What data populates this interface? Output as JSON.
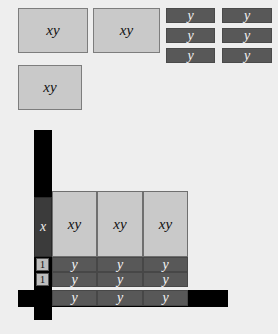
{
  "canvas": {
    "width": 278,
    "height": 334,
    "background": "#eeeeee"
  },
  "colors": {
    "xy_tile_fill": "#c9c9c9",
    "xy_tile_border": "#7d7d7d",
    "y_tile_fill": "#585858",
    "y_tile_text": "#f2f2f2",
    "x_header_fill": "#3b3b3b",
    "one_header_fill": "#bdbdbd",
    "frame_bar": "#000000"
  },
  "tray": {
    "label_xy": "xy",
    "label_y": "y",
    "xy_tiles": [
      {
        "name": "tray-xy-tile-1",
        "x": 18,
        "y": 8,
        "w": 70,
        "h": 45
      },
      {
        "name": "tray-xy-tile-2",
        "x": 93,
        "y": 8,
        "w": 67,
        "h": 45
      },
      {
        "name": "tray-xy-tile-3",
        "x": 18,
        "y": 65,
        "w": 64,
        "h": 45
      }
    ],
    "y_tiles": [
      {
        "name": "tray-y-strip-1",
        "x": 166,
        "y": 8,
        "w": 49,
        "h": 15
      },
      {
        "name": "tray-y-strip-2",
        "x": 222,
        "y": 8,
        "w": 50,
        "h": 15
      },
      {
        "name": "tray-y-strip-3",
        "x": 166,
        "y": 28,
        "w": 49,
        "h": 15
      },
      {
        "name": "tray-y-strip-4",
        "x": 222,
        "y": 28,
        "w": 50,
        "h": 15
      },
      {
        "name": "tray-y-strip-5",
        "x": 166,
        "y": 48,
        "w": 49,
        "h": 15
      },
      {
        "name": "tray-y-strip-6",
        "x": 222,
        "y": 48,
        "w": 50,
        "h": 15
      }
    ]
  },
  "model": {
    "frame": {
      "vertical_bar": {
        "x": 34,
        "y": 130,
        "w": 18,
        "h": 190
      },
      "horizontal_bar": {
        "x": 18,
        "y": 290,
        "w": 210,
        "h": 17
      }
    },
    "row_headers": [
      {
        "name": "row-header-x",
        "label": "x",
        "x": 34,
        "y": 197,
        "w": 18,
        "h": 60
      },
      {
        "name": "row-header-one-1",
        "label": "1",
        "x": 36,
        "y": 258,
        "w": 13,
        "h": 13
      },
      {
        "name": "row-header-one-2",
        "label": "1",
        "x": 36,
        "y": 273,
        "w": 13,
        "h": 13
      }
    ],
    "product_rows": [
      {
        "name": "product-row-xy",
        "label": "xy",
        "type": "xy",
        "y": 191,
        "h": 66,
        "cells": [
          {
            "x": 52,
            "w": 45
          },
          {
            "x": 97,
            "w": 46
          },
          {
            "x": 143,
            "w": 45
          }
        ]
      },
      {
        "name": "product-row-y-1",
        "label": "y",
        "type": "y",
        "y": 257,
        "h": 15,
        "cells": [
          {
            "x": 52,
            "w": 45
          },
          {
            "x": 97,
            "w": 46
          },
          {
            "x": 143,
            "w": 45
          }
        ]
      },
      {
        "name": "product-row-y-2",
        "label": "y",
        "type": "y",
        "y": 272,
        "h": 15,
        "cells": [
          {
            "x": 52,
            "w": 45
          },
          {
            "x": 97,
            "w": 46
          },
          {
            "x": 143,
            "w": 45
          }
        ]
      },
      {
        "name": "product-row-y-3",
        "label": "y",
        "type": "y",
        "y": 290,
        "h": 16,
        "cells": [
          {
            "x": 52,
            "w": 45
          },
          {
            "x": 97,
            "w": 46
          },
          {
            "x": 143,
            "w": 45
          }
        ]
      }
    ]
  }
}
